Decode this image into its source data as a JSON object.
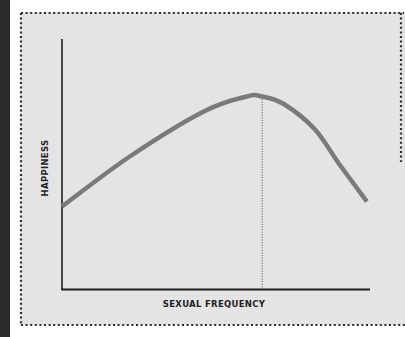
{
  "chart_data": {
    "type": "line",
    "title": "",
    "xlabel": "SEXUAL FREQUENCY",
    "ylabel": "HAPPINESS",
    "grid": false,
    "legend": null,
    "x_ticks": [],
    "y_ticks": [],
    "xlim": [
      0,
      1
    ],
    "ylim": [
      0,
      1
    ],
    "series": [
      {
        "name": "Happiness vs. sexual frequency",
        "color": "#7a7a7a",
        "x": [
          0.0,
          0.22,
          0.46,
          0.6,
          0.65,
          0.72,
          0.82,
          0.9,
          0.99
        ],
        "y": [
          0.33,
          0.53,
          0.71,
          0.77,
          0.77,
          0.74,
          0.64,
          0.5,
          0.35
        ]
      }
    ],
    "annotations": [
      {
        "type": "vertical-dotted-line",
        "x": 0.65,
        "from_y": 0.0,
        "to_y": 0.77,
        "description": "peak marker"
      }
    ]
  },
  "colors": {
    "panel_background": "#e4e4e4",
    "border_dots": "#2e2e2e",
    "axis": "#1e1e1e",
    "curve": "#7a7a7a",
    "left_strip": "#2b2b2b"
  }
}
